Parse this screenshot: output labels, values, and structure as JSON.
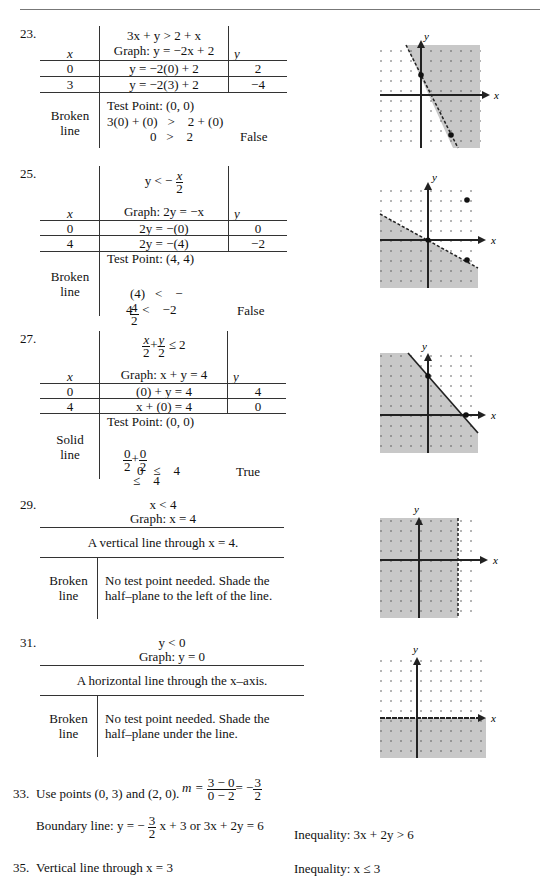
{
  "problems": {
    "p23": {
      "number": "23.",
      "inequality": "3x + y > 2 + x",
      "graph_eq": "Graph:  y = −2x + 2",
      "col_x": "x",
      "col_y": "y",
      "rows": [
        {
          "x": "0",
          "expr": "y = −2(0) + 2",
          "y": "2"
        },
        {
          "x": "3",
          "expr": "y = −2(3) + 2",
          "y": "−4"
        }
      ],
      "line_type": [
        "Broken",
        "line"
      ],
      "test_point": "Test Point:  (0, 0)",
      "step1": "3(0) + (0)   >    2 + (0)",
      "step2": "0   >    2",
      "result": "False"
    },
    "p25": {
      "number": "25.",
      "inequality_lhs": "y < −",
      "inequality_num": "x",
      "inequality_den": "2",
      "graph_eq": "Graph:  2y = −x",
      "col_x": "x",
      "col_y": "y",
      "rows": [
        {
          "x": "0",
          "expr": "2y = −(0)",
          "y": "0"
        },
        {
          "x": "4",
          "expr": "2y = −(4)",
          "y": "−2"
        }
      ],
      "line_type": [
        "Broken",
        "line"
      ],
      "test_point": "Test Point:  (4, 4)",
      "step1_lhs": "(4)   <    −",
      "step1_num": "4",
      "step1_den": "2",
      "step2": "4   <    −2",
      "result": "False"
    },
    "p27": {
      "number": "27.",
      "ineq_num1": "x",
      "ineq_den1": "2",
      "ineq_plus": "+",
      "ineq_num2": "y",
      "ineq_den2": "2",
      "ineq_rhs": "≤ 2",
      "graph_eq": "Graph:  x + y = 4",
      "col_x": "x",
      "col_y": "y",
      "rows": [
        {
          "x": "0",
          "expr": "(0) + y = 4",
          "y": "4"
        },
        {
          "x": "4",
          "expr": "x + (0) = 4",
          "y": "0"
        }
      ],
      "line_type": [
        "Solid",
        "line"
      ],
      "test_point": "Test Point:  (0, 0)",
      "step1_n1": "0",
      "step1_d1": "2",
      "step1_n2": "0",
      "step1_d2": "2",
      "step1_rhs": "≤    4",
      "step2": "0   ≤    4",
      "result": "True"
    },
    "p29": {
      "number": "29.",
      "inequality": "x < 4",
      "graph_eq": "Graph:  x = 4",
      "description": "A vertical line through x = 4.",
      "line_type": [
        "Broken",
        "line"
      ],
      "note_1": "No test point needed.  Shade the",
      "note_2": "half–plane to the left of the line."
    },
    "p31": {
      "number": "31.",
      "inequality": "y < 0",
      "graph_eq": "Graph:  y = 0",
      "description": "A horizontal line through the x–axis.",
      "line_type": [
        "Broken",
        "line"
      ],
      "note_1": "No test point needed.  Shade the",
      "note_2": "half–plane under the line."
    },
    "p33": {
      "number": "33.",
      "text": "Use points (0, 3) and (2, 0).",
      "m_label": "m =",
      "m_num": "3 − 0",
      "m_den": "0 − 2",
      "m_eq": "= −",
      "m_res_num": "3",
      "m_res_den": "2",
      "boundary_label": "Boundary line:  y =  −",
      "boundary_num": "3",
      "boundary_den": "2",
      "boundary_rest": "x + 3  or 3x + 2y = 6",
      "inequality": "Inequality:  3x + 2y > 6"
    },
    "p35": {
      "number": "35.",
      "text": "Vertical line through x = 3",
      "inequality": "Inequality:  x ≤ 3"
    }
  },
  "graphs": {
    "axis_x_label": "x",
    "axis_y_label": "y",
    "shade_color": "#c8c8c8"
  }
}
